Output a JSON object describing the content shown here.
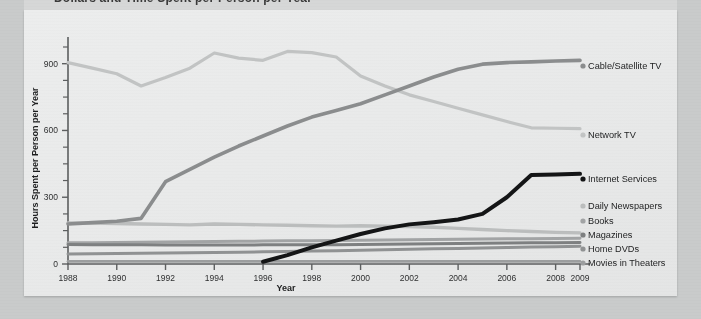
{
  "page": {
    "header_fragment": "Dollars and Time Spent per Person per Year",
    "background_color": "#c9cbcb",
    "sheet_color": "#eaebeb"
  },
  "chart_data": {
    "type": "line",
    "title": "",
    "xlabel": "Year",
    "ylabel": "Hours Spent per Person per Year",
    "xlim": [
      1988,
      2009
    ],
    "ylim": [
      0,
      975
    ],
    "yticks": [
      0,
      300,
      600,
      900
    ],
    "ytick_labels": [
      "0",
      "300",
      "600",
      "900"
    ],
    "ytick_minor_step": 75,
    "xticks": [
      1988,
      1990,
      1992,
      1994,
      1996,
      1998,
      2000,
      2002,
      2004,
      2006,
      2008,
      2009
    ],
    "xtick_labels": [
      "1988",
      "1990",
      "1992",
      "1994",
      "1996",
      "1998",
      "2000",
      "2002",
      "2004",
      "2006",
      "2008",
      "2009"
    ],
    "grid": false,
    "legend_position": "right",
    "x": [
      1988,
      1989,
      1990,
      1991,
      1992,
      1993,
      1994,
      1995,
      1996,
      1997,
      1998,
      1999,
      2000,
      2001,
      2002,
      2003,
      2004,
      2005,
      2006,
      2007,
      2008,
      2009
    ],
    "series": [
      {
        "name": "Cable/Satellite TV",
        "color": "#8b8d8e",
        "width": 3.6,
        "values": [
          180,
          186,
          192,
          205,
          370,
          425,
          480,
          530,
          575,
          620,
          660,
          690,
          720,
          760,
          800,
          840,
          875,
          898,
          905,
          908,
          912,
          915
        ]
      },
      {
        "name": "Network TV",
        "color": "#c2c4c4",
        "width": 3.2,
        "values": [
          905,
          880,
          855,
          800,
          838,
          880,
          948,
          925,
          915,
          955,
          950,
          930,
          845,
          800,
          760,
          730,
          700,
          670,
          640,
          612,
          610,
          608
        ]
      },
      {
        "name": "Internet Services",
        "color": "#141516",
        "width": 4.0,
        "values": [
          null,
          null,
          null,
          null,
          null,
          null,
          null,
          null,
          10,
          40,
          75,
          105,
          135,
          160,
          178,
          188,
          200,
          225,
          300,
          400,
          402,
          405
        ]
      },
      {
        "name": "Daily Newspapers",
        "color": "#bcbebe",
        "width": 3.4,
        "values": [
          185,
          184,
          182,
          180,
          178,
          176,
          180,
          178,
          176,
          174,
          172,
          170,
          172,
          170,
          168,
          165,
          160,
          155,
          150,
          146,
          142,
          140
        ]
      },
      {
        "name": "Books",
        "color": "#a2a4a5",
        "width": 3.0,
        "values": [
          95,
          96,
          97,
          98,
          99,
          100,
          101,
          102,
          103,
          104,
          105,
          106,
          107,
          108,
          109,
          110,
          111,
          112,
          113,
          114,
          115,
          116
        ]
      },
      {
        "name": "Magazines",
        "color": "#7e8081",
        "width": 3.0,
        "values": [
          88,
          87,
          86,
          86,
          85,
          85,
          85,
          85,
          86,
          86,
          87,
          87,
          88,
          89,
          90,
          91,
          92,
          93,
          94,
          95,
          96,
          97
        ]
      },
      {
        "name": "Home DVDs",
        "color": "#909293",
        "width": 3.0,
        "values": [
          45,
          46,
          47,
          48,
          49,
          50,
          52,
          53,
          55,
          56,
          58,
          60,
          62,
          64,
          66,
          68,
          70,
          72,
          74,
          76,
          78,
          80
        ]
      },
      {
        "name": "Movies in Theaters",
        "color": "#9c9e9f",
        "width": 2.6,
        "values": [
          12,
          12,
          12,
          12,
          12,
          12,
          12,
          12,
          12,
          12,
          12,
          12,
          12,
          12,
          12,
          12,
          12,
          12,
          12,
          12,
          12,
          12
        ]
      }
    ],
    "legend": [
      {
        "label": "Cable/Satellite TV",
        "color": "#8b8d8e",
        "y": 59
      },
      {
        "label": "Network TV",
        "color": "#c2c4c4",
        "y": 128
      },
      {
        "label": "Internet Services",
        "color": "#141516",
        "y": 172
      },
      {
        "label": "Daily Newspapers",
        "color": "#bcbebe",
        "y": 199
      },
      {
        "label": "Books",
        "color": "#a2a4a5",
        "y": 214
      },
      {
        "label": "Magazines",
        "color": "#7e8081",
        "y": 228
      },
      {
        "label": "Home DVDs",
        "color": "#909293",
        "y": 242
      },
      {
        "label": "Movies in Theaters",
        "color": "#9c9e9f",
        "y": 256
      }
    ]
  }
}
